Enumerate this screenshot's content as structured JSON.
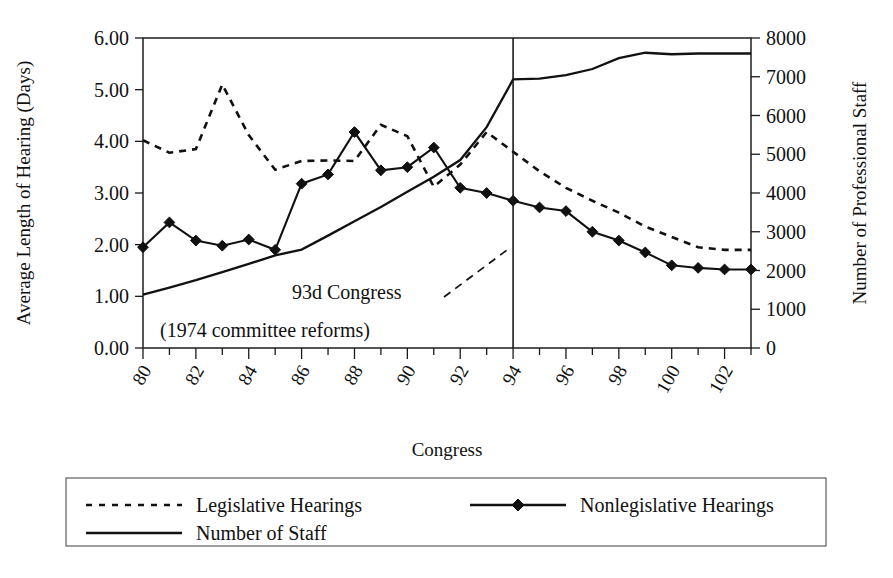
{
  "chart_data": {
    "type": "line",
    "title": "",
    "xlabel": "Congress",
    "ylabel": "Average Length of Hearing (Days)",
    "y2label": "Number of Professional Staff",
    "xlim": [
      80,
      103
    ],
    "ylim": [
      0,
      6
    ],
    "y2lim": [
      0,
      8000
    ],
    "grid": false,
    "legend_position": "bottom",
    "x": [
      80,
      81,
      82,
      83,
      84,
      85,
      86,
      87,
      88,
      89,
      90,
      91,
      92,
      93,
      94,
      95,
      96,
      97,
      98,
      99,
      100,
      101,
      102,
      103
    ],
    "xtick_labels": [
      "80",
      "82",
      "84",
      "86",
      "88",
      "90",
      "92",
      "94",
      "96",
      "98",
      "100",
      "102"
    ],
    "xtick_values": [
      80,
      82,
      84,
      86,
      88,
      90,
      92,
      94,
      96,
      98,
      100,
      102
    ],
    "ytick_labels": [
      "0.00",
      "1.00",
      "2.00",
      "3.00",
      "4.00",
      "5.00",
      "6.00"
    ],
    "ytick_values": [
      0,
      1,
      2,
      3,
      4,
      5,
      6
    ],
    "y2tick_labels": [
      "0",
      "1000",
      "2000",
      "3000",
      "4000",
      "5000",
      "6000",
      "7000",
      "8000"
    ],
    "y2tick_values": [
      0,
      1000,
      2000,
      3000,
      4000,
      5000,
      6000,
      7000,
      8000
    ],
    "series": [
      {
        "name": "Legislative Hearings",
        "axis": "left",
        "style": "dashed",
        "marker": "none",
        "values": [
          4.02,
          3.78,
          3.85,
          5.1,
          4.12,
          3.45,
          3.62,
          3.63,
          3.62,
          4.32,
          4.1,
          3.12,
          3.55,
          4.18,
          3.8,
          3.42,
          3.1,
          2.85,
          2.62,
          2.35,
          2.15,
          1.95,
          1.9,
          1.9
        ]
      },
      {
        "name": "Nonlegislative Hearings",
        "axis": "left",
        "style": "solid",
        "marker": "diamond",
        "values": [
          1.95,
          2.43,
          2.08,
          1.98,
          2.1,
          1.9,
          3.18,
          3.36,
          4.18,
          3.44,
          3.5,
          3.88,
          3.1,
          3.0,
          2.85,
          2.72,
          2.65,
          2.25,
          2.08,
          1.85,
          1.6,
          1.55,
          1.52,
          1.52
        ]
      },
      {
        "name": "Number of Staff",
        "axis": "right",
        "style": "solid",
        "marker": "none",
        "values": [
          1380,
          1560,
          1750,
          1960,
          2170,
          2390,
          2540,
          2900,
          3270,
          3640,
          4030,
          4420,
          4850,
          5700,
          6930,
          6950,
          7040,
          7200,
          7480,
          7620,
          7580,
          7600,
          7600,
          7600
        ]
      }
    ],
    "annotations": [
      {
        "name": "reform-marker",
        "text_line1": "93d Congress",
        "text_line2": "(1974 committee reforms)",
        "at_x": 94,
        "vertical_rule": true
      }
    ]
  },
  "legend": {
    "items": [
      {
        "label": "Legislative Hearings",
        "style": "dashed",
        "marker": "none"
      },
      {
        "label": "Nonlegislative Hearings",
        "style": "solid",
        "marker": "diamond"
      },
      {
        "label": "Number of Staff",
        "style": "solid",
        "marker": "none"
      }
    ]
  },
  "axes": {
    "left_title": "Average Length of Hearing (Days)",
    "right_title": "Number of Professional Staff",
    "bottom_title": "Congress"
  },
  "annotation": {
    "line1": "93d Congress",
    "line2": "(1974 committee reforms)"
  },
  "colors": {
    "ink": "#111111",
    "frame": "#2b2b2b",
    "legend_border": "#6a6a6a",
    "background": "#ffffff"
  }
}
